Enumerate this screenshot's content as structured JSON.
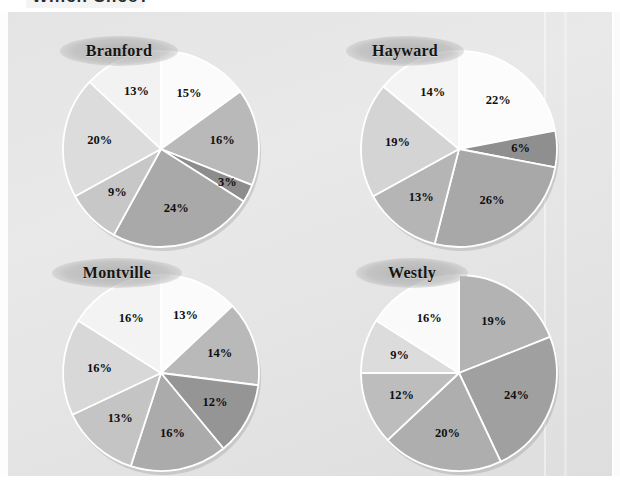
{
  "page": {
    "top_fragment": "Which Slice?",
    "background_color": "#e6e6e6",
    "panel_color": "#e4e4e4"
  },
  "chart_data": {
    "type": "pie",
    "title": "Which Slice?",
    "legend": "none",
    "value_suffix": "%",
    "charts": [
      {
        "title": "Branford",
        "values": [
          15,
          16,
          3,
          24,
          9,
          20,
          13
        ],
        "labels": [
          "15%",
          "16%",
          "3%",
          "24%",
          "9%",
          "20%",
          "13%"
        ],
        "colors": [
          "#fbfbfb",
          "#b9b9b9",
          "#8d8d8d",
          "#a9a9a9",
          "#c7c7c7",
          "#dcdcdc",
          "#f2f2f2"
        ],
        "start_angle": 0,
        "total": 100
      },
      {
        "title": "Hayward",
        "values": [
          22,
          6,
          26,
          13,
          19,
          14
        ],
        "labels": [
          "22%",
          "6%",
          "26%",
          "13%",
          "19%",
          "14%"
        ],
        "colors": [
          "#fcfcfc",
          "#8f8f8f",
          "#a8a8a8",
          "#b5b5b5",
          "#d4d4d4",
          "#f4f4f4"
        ],
        "start_angle": 0,
        "total": 100
      },
      {
        "title": "Montville",
        "values": [
          13,
          14,
          12,
          16,
          13,
          16,
          16
        ],
        "labels": [
          "13%",
          "14%",
          "12%",
          "16%",
          "13%",
          "16%",
          "16%"
        ],
        "colors": [
          "#fbfbfb",
          "#b9b9b9",
          "#959595",
          "#ababab",
          "#c4c4c4",
          "#d8d8d8",
          "#f3f3f3"
        ],
        "start_angle": 0,
        "total": 100
      },
      {
        "title": "Westly",
        "values": [
          19,
          24,
          20,
          12,
          9,
          16
        ],
        "labels": [
          "19%",
          "24%",
          "20%",
          "12%",
          "9%",
          "16%"
        ],
        "colors": [
          "#b3b3b3",
          "#a0a0a0",
          "#aeaeae",
          "#bdbdbd",
          "#dcdcdc",
          "#fafafa"
        ],
        "start_angle": 0,
        "total": 100
      }
    ]
  }
}
